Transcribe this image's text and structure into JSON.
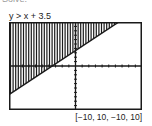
{
  "header": {
    "cut_text": "Solve.",
    "title": "y > x + 3.5"
  },
  "window_label": "[−10, 10, −10, 10]",
  "chart_data": {
    "type": "area",
    "title": "y > x + 3.5",
    "inequality": "y > x + 3.5",
    "boundary_line": {
      "slope": 1,
      "intercept": 3.5,
      "style": "solid"
    },
    "shaded_region": "above line",
    "shading_style": "vertical lines",
    "xlim": [
      -10,
      10
    ],
    "ylim": [
      -10,
      10
    ],
    "xscl": 1,
    "yscl": 1,
    "xlabel": "",
    "ylabel": "",
    "grid": false,
    "window": "[-10, 10, -10, 10]"
  },
  "colors": {
    "ink": "#1a1a1a",
    "background": "#ffffff"
  }
}
